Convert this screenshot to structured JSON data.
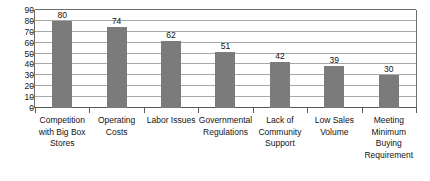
{
  "chart_data": {
    "type": "bar",
    "title": "",
    "subtitle": "",
    "xlabel": "",
    "ylabel": "",
    "ylim": [
      0,
      90
    ],
    "ytick_step": 10,
    "yticks": [
      0,
      10,
      20,
      30,
      40,
      50,
      60,
      70,
      80,
      90
    ],
    "ytick_labels": [
      "0",
      "10",
      "20",
      "30",
      "40",
      "50",
      "60",
      "70",
      "80",
      "90"
    ],
    "grid": true,
    "grid_axis": "y",
    "legend": false,
    "legend_position": "none",
    "bar_color": "#7b7b7b",
    "gridline_color": "#a8a8a8",
    "axis_color": "#5a5a5a",
    "show_value_labels": true,
    "categories": [
      "Competition with Big Box Stores",
      "Operating Costs",
      "Labor Issues",
      "Governmental Regulations",
      "Lack of Community Support",
      "Low Sales Volume",
      "Meeting Minimum Buying Requirement"
    ],
    "values": [
      80,
      74,
      62,
      51,
      42,
      39,
      30
    ],
    "value_labels": [
      "80",
      "74",
      "62",
      "51",
      "42",
      "39",
      "30"
    ]
  }
}
